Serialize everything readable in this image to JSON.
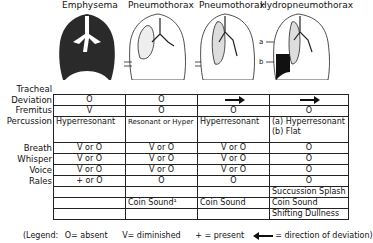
{
  "columns": [
    {
      "title": "Emphysema",
      "x": 62
    },
    {
      "title": "Pneumothorax",
      "x": 129
    },
    {
      "title": "Pneumothorax",
      "x": 200
    },
    {
      "title": "Hydropneumothorax",
      "x": 262
    }
  ],
  "hydro_labels": {
    "a": "a",
    "b": "b"
  },
  "row_labels": {
    "tracheal": "Tracheal",
    "deviation": "Deviation",
    "fremitus": "Fremitus",
    "percussion": "Percussion",
    "breath": "Breath",
    "whisper": "Whisper",
    "voice": "Voice",
    "rales": "Rales"
  },
  "table": {
    "deviation": [
      "O",
      "O",
      "arrow-right",
      "arrow-right"
    ],
    "fremitus": [
      "V",
      "O",
      "O",
      "O"
    ],
    "percussion": [
      "Hyperresonant",
      "Resonant or Hyper",
      "Hyperresonant",
      "(a) Hyperresonant"
    ],
    "percussion_b": [
      "",
      "",
      "",
      "(b) Flat"
    ],
    "breath": [
      "V or O",
      "V or O",
      "V or O",
      "O"
    ],
    "whisper": [
      "V or O",
      "V or O",
      "V or O",
      "O"
    ],
    "voice": [
      "V or O",
      "V or O",
      "V or O",
      "O"
    ],
    "rales": [
      "+ or O",
      "O",
      "O",
      "O"
    ],
    "extra1": [
      "",
      "",
      "",
      "Succussion Splash"
    ],
    "extra2": [
      "",
      "Coin Sound¹",
      "Coin Sound",
      "Coin Sound"
    ],
    "extra3": [
      "",
      "",
      "",
      "Shifting Dullness"
    ]
  },
  "legend": {
    "open": "(Legend:",
    "absent": "O= absent",
    "diminished": "V= diminished",
    "present": "+ =  present",
    "direction": "= direction of deviation)"
  }
}
